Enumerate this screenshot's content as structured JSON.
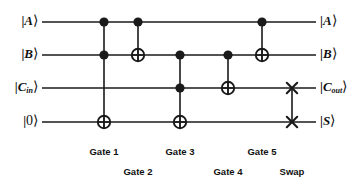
{
  "figure": {
    "name": "quantum-full-adder-circuit",
    "width": 358,
    "height": 185,
    "background": "#ffffff",
    "wire_color": "#1a1a1a",
    "gate_color": "#1a1a1a"
  },
  "inputs": [
    {
      "id": "in-a",
      "text_prefix": "|",
      "symbol": "A",
      "subscript": "",
      "text_suffix": "⟩",
      "y": 22
    },
    {
      "id": "in-b",
      "text_prefix": "|",
      "symbol": "B",
      "subscript": "",
      "text_suffix": "⟩",
      "y": 55
    },
    {
      "id": "in-cin",
      "text_prefix": "|",
      "symbol": "C",
      "subscript": "in",
      "text_suffix": "⟩",
      "y": 88
    },
    {
      "id": "in-zero",
      "text_prefix": "|",
      "symbol": "0",
      "subscript": "",
      "text_suffix": "⟩",
      "y": 122
    }
  ],
  "outputs": [
    {
      "id": "out-a",
      "text_prefix": "|",
      "symbol": "A",
      "subscript": "",
      "text_suffix": "⟩",
      "y": 22
    },
    {
      "id": "out-b",
      "text_prefix": "|",
      "symbol": "B",
      "subscript": "",
      "text_suffix": "⟩",
      "y": 55
    },
    {
      "id": "out-cout",
      "text_prefix": "|",
      "symbol": "C",
      "subscript": "out",
      "text_suffix": "⟩",
      "y": 88
    },
    {
      "id": "out-s",
      "text_prefix": "|",
      "symbol": "S",
      "subscript": "",
      "text_suffix": "⟩",
      "y": 122
    }
  ],
  "wires": [
    {
      "id": "wire-a",
      "label": "A",
      "y": 22,
      "x1": 42,
      "x2": 316
    },
    {
      "id": "wire-b",
      "label": "B",
      "y": 55,
      "x1": 42,
      "x2": 316
    },
    {
      "id": "wire-cin",
      "label": "Cin",
      "y": 88,
      "x1": 42,
      "x2": 316
    },
    {
      "id": "wire-s",
      "label": "0",
      "y": 122,
      "x1": 42,
      "x2": 316
    }
  ],
  "gates": [
    {
      "id": "gate-1",
      "label": "Gate 1",
      "type": "toffoli",
      "x": 104,
      "controls_y": [
        22,
        55
      ],
      "target_y": 122,
      "label_x": 104,
      "label_y": 147
    },
    {
      "id": "gate-2",
      "label": "Gate 2",
      "type": "cnot",
      "x": 138,
      "controls_y": [
        22
      ],
      "target_y": 55,
      "label_x": 138,
      "label_y": 167
    },
    {
      "id": "gate-3",
      "label": "Gate 3",
      "type": "toffoli",
      "x": 180,
      "controls_y": [
        55,
        88
      ],
      "target_y": 122,
      "label_x": 180,
      "label_y": 147
    },
    {
      "id": "gate-4",
      "label": "Gate 4",
      "type": "cnot",
      "x": 228,
      "controls_y": [
        55
      ],
      "target_y": 88,
      "label_x": 228,
      "label_y": 167
    },
    {
      "id": "gate-5",
      "label": "Gate 5",
      "type": "cnot",
      "x": 262,
      "controls_y": [
        22
      ],
      "target_y": 55,
      "label_x": 262,
      "label_y": 147
    },
    {
      "id": "swap",
      "label": "Swap",
      "type": "swap",
      "x": 292,
      "controls_y": [],
      "target_y": 0,
      "swap_y": [
        88,
        122
      ],
      "label_x": 292,
      "label_y": 167
    }
  ],
  "geometry": {
    "control_radius": 4.6,
    "target_radius": 6.2,
    "swap_arm": 5.2,
    "wire_width": 1.6,
    "link_width": 1.6,
    "left_label_x": 38,
    "right_label_x": 320
  }
}
